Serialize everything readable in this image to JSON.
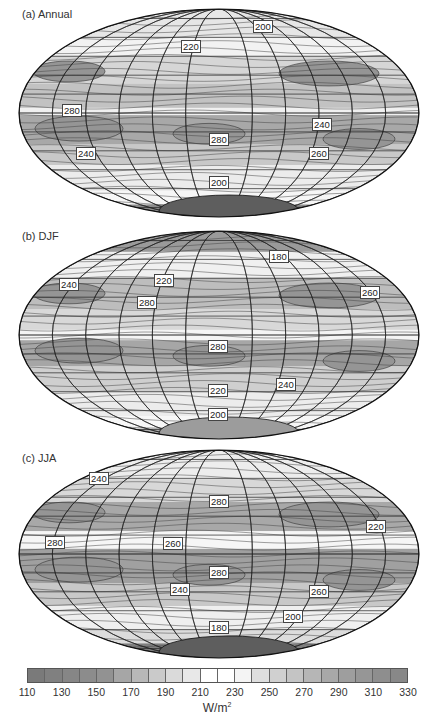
{
  "chart_data": [
    {
      "type": "heatmap",
      "projection": "Hammer/Mollweide (global, elliptical)",
      "title": "(a) Annual",
      "contour_labels": [
        {
          "value": 200,
          "pos": "N. Asia"
        },
        {
          "value": 220,
          "pos": "N. Atlantic / Greenland"
        },
        {
          "value": 280,
          "pos": "E. tropical Pacific"
        },
        {
          "value": 280,
          "pos": "S. Atlantic subtropics"
        },
        {
          "value": 240,
          "pos": "W. Pacific / Maritime continent"
        },
        {
          "value": 240,
          "pos": "S. Pacific midlatitudes"
        },
        {
          "value": 260,
          "pos": "S. Indian Ocean"
        },
        {
          "value": 200,
          "pos": "Southern Ocean"
        }
      ],
      "colorbar": {
        "min": 110,
        "max": 330,
        "step": 10,
        "unit": "W/m²"
      }
    },
    {
      "type": "heatmap",
      "projection": "Hammer/Mollweide (global, elliptical)",
      "title": "(b) DJF",
      "contour_labels": [
        {
          "value": 180,
          "pos": "N. Asia"
        },
        {
          "value": 240,
          "pos": "N. Pacific east"
        },
        {
          "value": 220,
          "pos": "N. Atlantic"
        },
        {
          "value": 280,
          "pos": "Caribbean / subtropical Atlantic"
        },
        {
          "value": 260,
          "pos": "W. Pacific subtropics"
        },
        {
          "value": 280,
          "pos": "S. Atlantic subtropics"
        },
        {
          "value": 220,
          "pos": "S. Atlantic midlatitudes"
        },
        {
          "value": 240,
          "pos": "S. Indian Ocean"
        },
        {
          "value": 200,
          "pos": "Antarctica coast"
        }
      ],
      "colorbar": {
        "min": 110,
        "max": 330,
        "step": 10,
        "unit": "W/m²"
      }
    },
    {
      "type": "heatmap",
      "projection": "Hammer/Mollweide (global, elliptical)",
      "title": "(c) JJA",
      "contour_labels": [
        {
          "value": 240,
          "pos": "NE Pacific / Alaska"
        },
        {
          "value": 280,
          "pos": "N. Africa / Sahara"
        },
        {
          "value": 220,
          "pos": "W. Pacific / SE Asia"
        },
        {
          "value": 280,
          "pos": "E. tropical Pacific"
        },
        {
          "value": 260,
          "pos": "Atlantic ITCZ"
        },
        {
          "value": 280,
          "pos": "S. Atlantic subtropics"
        },
        {
          "value": 240,
          "pos": "S. Pacific midlatitudes"
        },
        {
          "value": 260,
          "pos": "S. Indian Ocean"
        },
        {
          "value": 200,
          "pos": "Southern Ocean"
        },
        {
          "value": 180,
          "pos": "Antarctica"
        }
      ],
      "colorbar": {
        "min": 110,
        "max": 330,
        "step": 10,
        "unit": "W/m²"
      }
    }
  ],
  "panels": [
    {
      "title": "(a) Annual",
      "top": 8,
      "labels": [
        {
          "text": "200",
          "x": 253,
          "y": 26
        },
        {
          "text": "220",
          "x": 181,
          "y": 46
        },
        {
          "text": "280",
          "x": 62,
          "y": 110
        },
        {
          "text": "280",
          "x": 209,
          "y": 139
        },
        {
          "text": "240",
          "x": 312,
          "y": 124
        },
        {
          "text": "240",
          "x": 76,
          "y": 153
        },
        {
          "text": "260",
          "x": 309,
          "y": 153
        },
        {
          "text": "200",
          "x": 209,
          "y": 182
        }
      ]
    },
    {
      "title": "(b) DJF",
      "top": 228,
      "labels": [
        {
          "text": "180",
          "x": 269,
          "y": 34
        },
        {
          "text": "240",
          "x": 59,
          "y": 62
        },
        {
          "text": "220",
          "x": 154,
          "y": 58
        },
        {
          "text": "280",
          "x": 137,
          "y": 80
        },
        {
          "text": "260",
          "x": 360,
          "y": 70
        },
        {
          "text": "280",
          "x": 208,
          "y": 124
        },
        {
          "text": "220",
          "x": 208,
          "y": 168
        },
        {
          "text": "240",
          "x": 276,
          "y": 162
        },
        {
          "text": "200",
          "x": 208,
          "y": 192
        }
      ]
    },
    {
      "title": "(c) JJA",
      "top": 450,
      "labels": [
        {
          "text": "240",
          "x": 89,
          "y": 34
        },
        {
          "text": "280",
          "x": 209,
          "y": 57
        },
        {
          "text": "220",
          "x": 366,
          "y": 82
        },
        {
          "text": "280",
          "x": 45,
          "y": 98
        },
        {
          "text": "260",
          "x": 163,
          "y": 99
        },
        {
          "text": "280",
          "x": 209,
          "y": 128
        },
        {
          "text": "240",
          "x": 170,
          "y": 145
        },
        {
          "text": "260",
          "x": 309,
          "y": 147
        },
        {
          "text": "200",
          "x": 283,
          "y": 172
        },
        {
          "text": "180",
          "x": 209,
          "y": 183
        }
      ]
    }
  ],
  "colorbar": {
    "bins": [
      "#7a7a7a",
      "#808080",
      "#868686",
      "#8c8c8c",
      "#929292",
      "#a6a6a6",
      "#b8b8b8",
      "#cacaca",
      "#dadada",
      "#e8e8e8",
      "#ffffff",
      "#ffffff",
      "#f4f4f4",
      "#dedede",
      "#d0d0d0",
      "#c4c4c4",
      "#b6b6b6",
      "#a8a8a8",
      "#9e9e9e",
      "#969696",
      "#8e8e8e",
      "#888888"
    ],
    "ticks": [
      "110",
      "130",
      "150",
      "170",
      "190",
      "210",
      "230",
      "250",
      "270",
      "290",
      "310",
      "330"
    ],
    "unit": "W/m",
    "unit_sup": "2"
  }
}
